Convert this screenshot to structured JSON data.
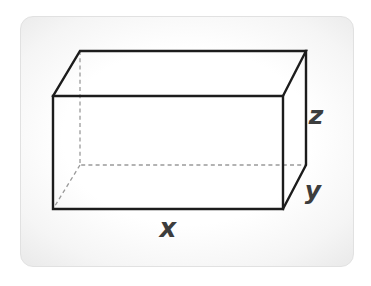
{
  "figure": {
    "labels": {
      "width": "x",
      "depth": "y",
      "height": "z"
    },
    "colors": {
      "visible_edge": "#1c1c1c",
      "hidden_edge": "#9a9a9a",
      "label_text": "#3d3d3d",
      "card_background": "#ffffff",
      "card_edge": "#e1e1e1"
    }
  }
}
